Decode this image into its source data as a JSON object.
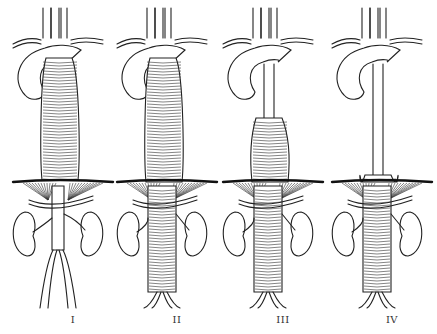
{
  "figure": {
    "panels": [
      {
        "label": "I",
        "cx": 73,
        "aneurysm_top": 58,
        "aneurysm_bottom": 180,
        "stripes_below_diaphragm": false
      },
      {
        "label": "II",
        "cx": 177,
        "aneurysm_top": 48,
        "aneurysm_bottom": 300,
        "stripes_below_diaphragm": true
      },
      {
        "label": "III",
        "cx": 283,
        "aneurysm_top": 118,
        "aneurysm_bottom": 295,
        "stripes_below_diaphragm": true
      },
      {
        "label": "IV",
        "cx": 392,
        "aneurysm_top": 175,
        "aneurysm_bottom": 292,
        "stripes_below_diaphragm": true
      }
    ]
  }
}
